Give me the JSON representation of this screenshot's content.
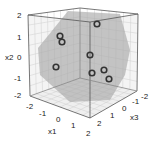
{
  "chart_data": {
    "type": "scatter",
    "dimensions": 3,
    "title": "",
    "axes": {
      "x1": {
        "label": "x1",
        "range": [
          -2,
          2
        ],
        "ticks": [
          "-2",
          "-1",
          "0",
          "1",
          "2"
        ]
      },
      "x2": {
        "label": "x2",
        "range": [
          -2,
          2
        ],
        "ticks": [
          "-2",
          "-1",
          "0",
          "1",
          "2"
        ]
      },
      "x3": {
        "label": "x3",
        "range": [
          -2,
          2
        ],
        "ticks": [
          "-2",
          "-1",
          "0",
          "1",
          "2"
        ]
      }
    },
    "grid": true,
    "plane": {
      "description": "gray hexagonal cross-section plane through the cube",
      "color": "#a9a9a9"
    },
    "points_screen": [
      {
        "x": 97,
        "y": 24
      },
      {
        "x": 60,
        "y": 36
      },
      {
        "x": 62,
        "y": 42
      },
      {
        "x": 90,
        "y": 55
      },
      {
        "x": 56,
        "y": 67
      },
      {
        "x": 92,
        "y": 73
      },
      {
        "x": 104,
        "y": 70
      },
      {
        "x": 109,
        "y": 79
      }
    ],
    "point_count": 8,
    "marker": "open-circle",
    "marker_color": "#333333"
  },
  "labels": {
    "x1": "x1",
    "x2": "x2",
    "x3": "x3",
    "x2_ticks": [
      "2",
      "1",
      "0",
      "-1",
      "-2"
    ],
    "x1_ticks": [
      "-2",
      "-1",
      "0",
      "1",
      "2"
    ],
    "x3_ticks": [
      "2",
      "1",
      "0",
      "-1",
      "-2"
    ]
  }
}
